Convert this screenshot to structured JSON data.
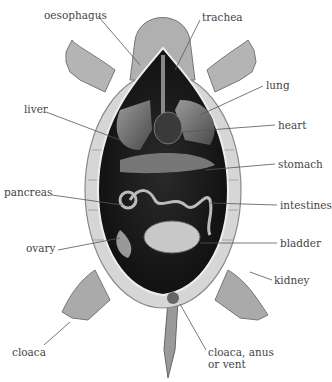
{
  "diagram": {
    "style": "grayscale illustration, ventral view with plastron removed",
    "colors": {
      "background": "#ffffff",
      "label_text": "#444444",
      "leader_line": "#555555",
      "body_cavity": "#1a1a1a",
      "shell": "#d8d8d8",
      "skin": "#a8a8a8"
    },
    "labels": [
      {
        "id": "oesophagus",
        "text": "oesophagus",
        "x": 44,
        "y": 10
      },
      {
        "id": "trachea",
        "text": "trachea",
        "x": 202,
        "y": 12
      },
      {
        "id": "lung",
        "text": "lung",
        "x": 266,
        "y": 80
      },
      {
        "id": "liver",
        "text": "liver",
        "x": 24,
        "y": 104
      },
      {
        "id": "heart",
        "text": "heart",
        "x": 278,
        "y": 120
      },
      {
        "id": "stomach",
        "text": "stomach",
        "x": 278,
        "y": 159
      },
      {
        "id": "pancreas",
        "text": "pancreas",
        "x": 4,
        "y": 187
      },
      {
        "id": "intestines",
        "text": "intestines",
        "x": 280,
        "y": 200
      },
      {
        "id": "ovary",
        "text": "ovary",
        "x": 26,
        "y": 243
      },
      {
        "id": "bladder",
        "text": "bladder",
        "x": 280,
        "y": 238
      },
      {
        "id": "kidney",
        "text": "kidney",
        "x": 274,
        "y": 275
      },
      {
        "id": "cloaca",
        "text": "cloaca",
        "x": 12,
        "y": 347
      },
      {
        "id": "vent1",
        "text": "cloaca, anus",
        "x": 208,
        "y": 347
      },
      {
        "id": "vent2",
        "text": "or vent",
        "x": 208,
        "y": 359
      }
    ]
  }
}
